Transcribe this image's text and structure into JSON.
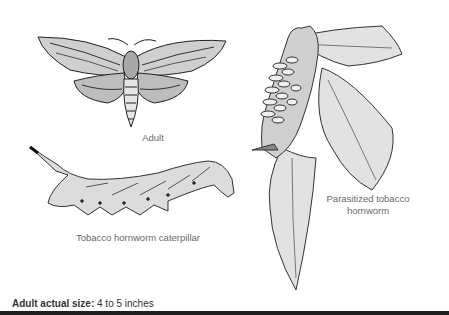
{
  "figures": {
    "adult": {
      "caption": "Adult",
      "icon": "hawk-moth-illustration"
    },
    "caterpillar": {
      "caption": "Tobacco hornworm caterpillar",
      "icon": "hornworm-caterpillar-illustration"
    },
    "parasitized": {
      "caption_line1": "Parasitized tobacco",
      "caption_line2": "hornworm",
      "icon": "parasitized-hornworm-on-leaf-illustration"
    }
  },
  "footer": {
    "label": "Adult actual size:",
    "value": " 4 to 5 inches"
  },
  "colors": {
    "caption_text": "#6a6a6a",
    "footer_text": "#333333",
    "bottom_bar": "#1e1e1e"
  }
}
